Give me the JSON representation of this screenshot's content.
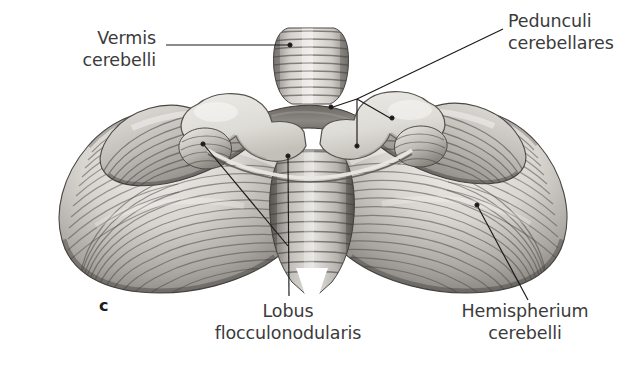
{
  "figure": {
    "letter": "c",
    "view": "anterior view of the cerebellum",
    "background_color": "#ffffff",
    "text_color": "#3b3b3b",
    "leader_color": "#1a1a1a"
  },
  "labels": {
    "vermis": {
      "line1": "Vermis",
      "line2": "cerebelli"
    },
    "pedunculi": {
      "line1": "Pedunculi",
      "line2": "cerebellares"
    },
    "lobus": {
      "line1": "Lobus",
      "line2": "flocculonodularis"
    },
    "hemispherium": {
      "line1": "Hemispherium",
      "line2": "cerebelli"
    }
  },
  "leaders": [
    {
      "name": "vermis-leader",
      "type": "straight",
      "path": "M 166 45 L 288 45",
      "dot": {
        "cx": 290,
        "cy": 45
      }
    },
    {
      "name": "pedunculi-leader",
      "type": "branched",
      "stem": "M 503 29 L 357 99",
      "branches": [
        {
          "path": "M 357 99 L 333 107",
          "dot": {
            "cx": 331,
            "cy": 107
          }
        },
        {
          "path": "M 357 99 L 390 118",
          "dot": {
            "cx": 392,
            "cy": 118
          }
        },
        {
          "path": "M 357 99 L 357 144",
          "dot": {
            "cx": 357,
            "cy": 146
          }
        }
      ]
    },
    {
      "name": "lobus-leader",
      "type": "straight",
      "path": "M 288 158 L 289 296",
      "dot": {
        "cx": 288,
        "cy": 156
      }
    },
    {
      "name": "lobus-secondary-leader",
      "type": "straight",
      "path": "M 204 145 L 288 246",
      "dot": {
        "cx": 203,
        "cy": 144
      }
    },
    {
      "name": "hemispherium-leader",
      "type": "straight",
      "path": "M 478 207 L 528 300",
      "dot": {
        "cx": 477,
        "cy": 205
      }
    }
  ],
  "anatomy": {
    "structures": [
      "Vermis cerebelli",
      "Pedunculi cerebellares",
      "Lobus flocculonodularis",
      "Hemispherium cerebelli"
    ],
    "palette": {
      "tissue_light": "#e8e6e2",
      "tissue_mid": "#b9b6b1",
      "tissue_dark": "#7d7a76",
      "tissue_shadow": "#4e4b48",
      "cut_surface": "#dedcd6",
      "cut_surface_dark": "#6e6b66"
    }
  }
}
